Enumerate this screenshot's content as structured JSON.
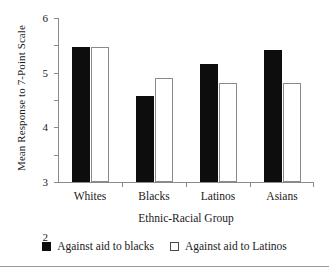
{
  "chart_data": {
    "type": "bar",
    "title": "",
    "xlabel": "Ethnic-Racial Group",
    "ylabel": "Mean Response to 7-Point Scale",
    "categories": [
      "Whites",
      "Blacks",
      "Latinos",
      "Asians"
    ],
    "series": [
      {
        "name": "Against aid to blacks",
        "style": "filled",
        "color": "#0d0d0d",
        "values": [
          4.94,
          3.15,
          4.31,
          4.82
        ]
      },
      {
        "name": "Against aid to Latinos",
        "style": "open",
        "color": "#ffffff",
        "values": [
          4.95,
          3.79,
          3.64,
          3.64
        ]
      }
    ],
    "ylim": [
      0,
      6
    ],
    "yticks": [
      0,
      1,
      2,
      3,
      4,
      5,
      6
    ],
    "ytick_labels": [
      "0",
      "1",
      "2",
      "3",
      "4",
      "5",
      "6"
    ],
    "grid": false,
    "legend_position": "bottom"
  },
  "legend": {
    "items": [
      {
        "label": "Against aid to blacks",
        "marker": "filled-square-icon"
      },
      {
        "label": "Against aid to Latinos",
        "marker": "open-square-icon"
      }
    ]
  },
  "axes": {
    "y_title": "Mean Response to 7-Point Scale",
    "x_title": "Ethnic-Racial Group",
    "y_tick_0": "0",
    "y_tick_1": "1",
    "y_tick_2": "2",
    "y_tick_3": "3",
    "y_tick_4": "4",
    "y_tick_5": "5",
    "y_tick_6": "6"
  },
  "categories": {
    "c0": "Whites",
    "c1": "Blacks",
    "c2": "Latinos",
    "c3": "Asians"
  }
}
